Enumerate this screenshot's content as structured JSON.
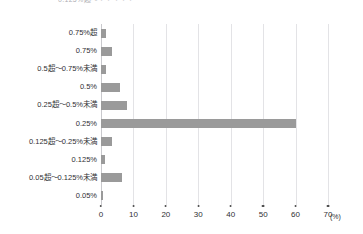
{
  "chart_data": {
    "type": "bar",
    "orientation": "horizontal",
    "title": "0.125%超〜・・・・・",
    "xlabel": "",
    "ylabel": "",
    "unit": "(%)",
    "xlim": [
      0,
      70
    ],
    "xticks": [
      0,
      10,
      20,
      30,
      40,
      50,
      60,
      70
    ],
    "xtick_labels": [
      "0",
      "10",
      "20",
      "30",
      "40",
      "50",
      "60",
      "70"
    ],
    "grid": true,
    "legend": false,
    "bar_color": "#9a9a9a",
    "categories": [
      "0.75%超",
      "0.75%",
      "0.5超〜0.75%未満",
      "0.5%",
      "0.25超〜0.5%未満",
      "0.25%",
      "0.125超〜0.25%未満",
      "0.125%",
      "0.05超〜0.125%未満",
      "0.05%"
    ],
    "values": [
      1.5,
      3.5,
      1.5,
      6.0,
      8.0,
      60.0,
      3.5,
      1.2,
      6.5,
      0.7
    ]
  }
}
